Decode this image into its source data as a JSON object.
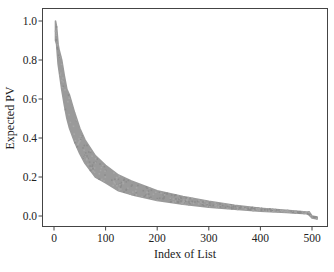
{
  "chart_data": {
    "type": "scatter",
    "title": "",
    "xlabel": "Index of List",
    "ylabel": "Expected PV",
    "xlim": [
      -24,
      531
    ],
    "ylim": [
      -0.05,
      1.07
    ],
    "xticks": [
      0,
      100,
      200,
      300,
      400,
      500
    ],
    "yticks": [
      0.0,
      0.2,
      0.4,
      0.6,
      0.8,
      1.0
    ],
    "xtick_labels": [
      "0",
      "100",
      "200",
      "300",
      "400",
      "500"
    ],
    "ytick_labels": [
      "0.0",
      "0.2",
      "0.4",
      "0.6",
      "0.8",
      "1.0"
    ],
    "grid": false,
    "legend": null,
    "marker_color": "#9a9a9a",
    "series": [
      {
        "name": "Expected PV (upper envelope)",
        "x": [
          3,
          5,
          8,
          10,
          15,
          20,
          25,
          30,
          40,
          50,
          60,
          80,
          100,
          125,
          150,
          200,
          250,
          300,
          350,
          400,
          450,
          490,
          495,
          500,
          510
        ],
        "values": [
          1.0,
          0.97,
          0.88,
          0.85,
          0.8,
          0.72,
          0.65,
          0.62,
          0.53,
          0.45,
          0.39,
          0.31,
          0.26,
          0.21,
          0.18,
          0.13,
          0.1,
          0.075,
          0.055,
          0.04,
          0.03,
          0.02,
          0.02,
          0.0,
          -0.005
        ]
      },
      {
        "name": "Expected PV (lower envelope)",
        "x": [
          3,
          5,
          8,
          10,
          15,
          20,
          25,
          30,
          40,
          50,
          60,
          80,
          100,
          125,
          150,
          200,
          250,
          300,
          350,
          400,
          450,
          490,
          495,
          500,
          510
        ],
        "values": [
          0.9,
          0.88,
          0.78,
          0.74,
          0.65,
          0.57,
          0.5,
          0.45,
          0.38,
          0.32,
          0.27,
          0.2,
          0.17,
          0.13,
          0.11,
          0.08,
          0.06,
          0.045,
          0.035,
          0.025,
          0.018,
          0.012,
          0.005,
          -0.01,
          -0.015
        ]
      }
    ]
  },
  "axes": {
    "xlabel": "Index of List",
    "ylabel": "Expected PV",
    "xtick_labels": [
      "0",
      "100",
      "200",
      "300",
      "400",
      "500"
    ],
    "ytick_labels": [
      "0.0",
      "0.2",
      "0.4",
      "0.6",
      "0.8",
      "1.0"
    ]
  }
}
